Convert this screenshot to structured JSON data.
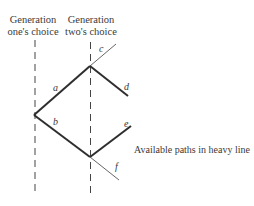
{
  "headers": {
    "gen1": [
      "Generation",
      "one's choice"
    ],
    "gen2": [
      "Generation",
      "two's choice"
    ]
  },
  "branches": {
    "a": "a",
    "b": "b",
    "c": "c",
    "d": "d",
    "e": "e",
    "f": "f"
  },
  "note": "Available paths in heavy line",
  "colors": {
    "ink": "#333333",
    "light": "#555555"
  }
}
